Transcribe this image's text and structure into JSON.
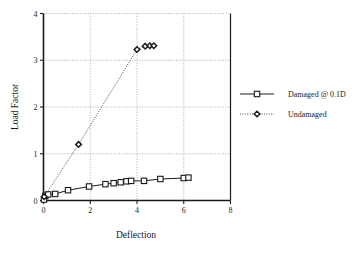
{
  "chart_data": {
    "type": "line",
    "title": "",
    "xlabel": "Deflection",
    "ylabel": "Load Factor",
    "xlim": [
      0,
      8
    ],
    "ylim": [
      0,
      4
    ],
    "xticks": [
      "0",
      "2",
      "4",
      "6",
      "8"
    ],
    "yticks": [
      "0",
      "1",
      "2",
      "3",
      "4"
    ],
    "xtick_values": [
      0,
      2,
      4,
      6,
      8
    ],
    "ytick_values": [
      0,
      1,
      2,
      3,
      4
    ],
    "grid": true,
    "grid_style": "dotted",
    "legend_position": "right-outside",
    "legend_border": false,
    "series": [
      {
        "name": "Damaged @ 0.1D",
        "marker": "square-open",
        "line_style": "solid",
        "color": "#1a1a1a",
        "points": [
          [
            0.02,
            0.02
          ],
          [
            0.08,
            0.1
          ],
          [
            0.2,
            0.13
          ],
          [
            0.5,
            0.14
          ],
          [
            1.05,
            0.22
          ],
          [
            1.95,
            0.3
          ],
          [
            2.65,
            0.35
          ],
          [
            3.0,
            0.37
          ],
          [
            3.3,
            0.39
          ],
          [
            3.55,
            0.41
          ],
          [
            3.75,
            0.42
          ],
          [
            4.3,
            0.42
          ],
          [
            5.0,
            0.46
          ],
          [
            6.0,
            0.48
          ],
          [
            6.2,
            0.49
          ]
        ]
      },
      {
        "name": "Undamaged",
        "marker": "diamond-open",
        "line_style": "dotted",
        "color": "#1a1a1a",
        "points": [
          [
            0.03,
            0.08
          ],
          [
            1.5,
            1.2
          ],
          [
            4.0,
            3.23
          ],
          [
            4.35,
            3.3
          ],
          [
            4.55,
            3.31
          ],
          [
            4.72,
            3.31
          ]
        ]
      }
    ]
  },
  "legend": {
    "items": [
      {
        "label": "Damaged @ 0.1D"
      },
      {
        "label": "Undamaged"
      }
    ]
  },
  "axes": {
    "x_title": "Deflection",
    "y_title": "Load Factor"
  }
}
